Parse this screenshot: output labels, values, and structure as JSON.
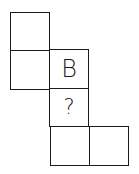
{
  "diagram": {
    "type": "cube-net",
    "cells": [
      {
        "id": "top-left-upper",
        "label": ""
      },
      {
        "id": "top-left-lower",
        "label": ""
      },
      {
        "id": "middle-face-b",
        "label": "B"
      },
      {
        "id": "middle-face-question",
        "label": "?"
      },
      {
        "id": "bottom-left",
        "label": ""
      },
      {
        "id": "bottom-right",
        "label": ""
      }
    ]
  }
}
